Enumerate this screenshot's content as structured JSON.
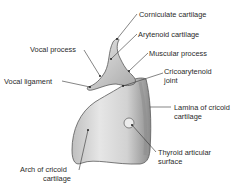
{
  "diagram": {
    "labels": [
      {
        "id": "corniculate",
        "text": "Corniculate cartilage"
      },
      {
        "id": "arytenoid",
        "text": "Arytenoid cartilage"
      },
      {
        "id": "vocal_process",
        "text": "Vocal process"
      },
      {
        "id": "muscular_process",
        "text": "Muscular process"
      },
      {
        "id": "cricoarytenoid_1",
        "text": "Cricoarytenoid"
      },
      {
        "id": "cricoarytenoid_2",
        "text": "joint"
      },
      {
        "id": "vocal_ligament",
        "text": "Vocal ligament"
      },
      {
        "id": "lamina_1",
        "text": "Lamina of cricoid"
      },
      {
        "id": "lamina_2",
        "text": "cartilage"
      },
      {
        "id": "thyroid_1",
        "text": "Thyroid articular"
      },
      {
        "id": "thyroid_2",
        "text": "surface"
      },
      {
        "id": "arch_1",
        "text": "Arch of cricoid"
      },
      {
        "id": "arch_2",
        "text": "cartilage"
      }
    ]
  }
}
